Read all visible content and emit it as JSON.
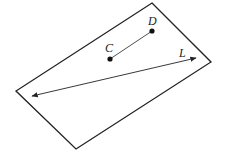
{
  "diagram": {
    "type": "geometry-plane",
    "colors": {
      "stroke": "#222222",
      "background": "#ffffff"
    },
    "plane": {
      "vertices": [
        [
          152,
          3
        ],
        [
          211,
          62
        ],
        [
          76,
          149
        ],
        [
          16,
          91
        ]
      ]
    },
    "points": [
      {
        "id": "C",
        "label": "C",
        "x": 110,
        "y": 59,
        "label_x": 105,
        "label_y": 52
      },
      {
        "id": "D",
        "label": "D",
        "x": 152,
        "y": 31,
        "label_x": 148,
        "label_y": 25
      }
    ],
    "segment": {
      "from": "C",
      "to": "D"
    },
    "line": {
      "label": "L",
      "x1": 32,
      "y1": 96,
      "x2": 196,
      "y2": 58,
      "label_x": 179,
      "label_y": 57,
      "arrows": "both"
    }
  }
}
